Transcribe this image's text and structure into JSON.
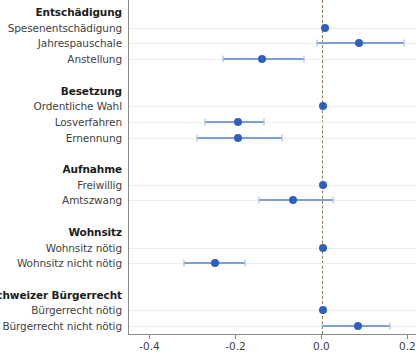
{
  "chart_data": {
    "type": "scatter",
    "subtype": "coefficient-forest-plot",
    "title": "",
    "xlabel": "",
    "ylabel": "",
    "xlim": [
      -0.45,
      0.22
    ],
    "xticks": [
      -0.4,
      -0.2,
      0.0,
      0.2
    ],
    "xticklabels": [
      "-0.4",
      "-0.2",
      "0.0",
      "0.2"
    ],
    "grid": "horizontal-rows-only",
    "legend": "none",
    "reference_line": 0.0,
    "point_color": "#2f5fbd",
    "ci_color": "#7c9fd6",
    "reference_line_color": "#8d7f52",
    "rows": [
      {
        "label": "Entschädigung",
        "kind": "group",
        "estimate": null,
        "ci_low": null,
        "ci_high": null
      },
      {
        "label": "Spesenentschädigung",
        "kind": "estimate",
        "estimate": 0.005,
        "ci_low": 0.005,
        "ci_high": 0.005
      },
      {
        "label": "Jahrespauschale",
        "kind": "estimate",
        "estimate": 0.085,
        "ci_low": -0.012,
        "ci_high": 0.19
      },
      {
        "label": "Anstellung",
        "kind": "estimate",
        "estimate": -0.14,
        "ci_low": -0.232,
        "ci_high": -0.043
      },
      {
        "label": "",
        "kind": "spacer",
        "estimate": null,
        "ci_low": null,
        "ci_high": null
      },
      {
        "label": "Besetzung",
        "kind": "group",
        "estimate": null,
        "ci_low": null,
        "ci_high": null
      },
      {
        "label": "Ordentliche Wahl",
        "kind": "estimate",
        "estimate": 0.002,
        "ci_low": 0.002,
        "ci_high": 0.002
      },
      {
        "label": "Losverfahren",
        "kind": "estimate",
        "estimate": -0.196,
        "ci_low": -0.274,
        "ci_high": -0.137
      },
      {
        "label": "Ernennung",
        "kind": "estimate",
        "estimate": -0.196,
        "ci_low": -0.291,
        "ci_high": -0.095
      },
      {
        "label": "",
        "kind": "spacer",
        "estimate": null,
        "ci_low": null,
        "ci_high": null
      },
      {
        "label": "Aufnahme",
        "kind": "group",
        "estimate": null,
        "ci_low": null,
        "ci_high": null
      },
      {
        "label": "Freiwillig",
        "kind": "estimate",
        "estimate": 0.002,
        "ci_low": 0.002,
        "ci_high": 0.002
      },
      {
        "label": "Amtszwang",
        "kind": "estimate",
        "estimate": -0.068,
        "ci_low": -0.147,
        "ci_high": 0.025
      },
      {
        "label": "",
        "kind": "spacer",
        "estimate": null,
        "ci_low": null,
        "ci_high": null
      },
      {
        "label": "Wohnsitz",
        "kind": "group",
        "estimate": null,
        "ci_low": null,
        "ci_high": null
      },
      {
        "label": "Wohnsitz nötig",
        "kind": "estimate",
        "estimate": 0.002,
        "ci_low": 0.002,
        "ci_high": 0.002
      },
      {
        "label": "Wohnsitz nicht nötig",
        "kind": "estimate",
        "estimate": -0.249,
        "ci_low": -0.322,
        "ci_high": -0.179
      },
      {
        "label": "",
        "kind": "spacer",
        "estimate": null,
        "ci_low": null,
        "ci_high": null
      },
      {
        "label": "Schweizer Bürgerrecht",
        "kind": "group",
        "estimate": null,
        "ci_low": null,
        "ci_high": null
      },
      {
        "label": "Bürgerrecht nötig",
        "kind": "estimate",
        "estimate": 0.002,
        "ci_low": 0.002,
        "ci_high": 0.002
      },
      {
        "label": "Bürgerrecht nicht nötig",
        "kind": "estimate",
        "estimate": 0.082,
        "ci_low": 0.0,
        "ci_high": 0.158
      }
    ]
  }
}
